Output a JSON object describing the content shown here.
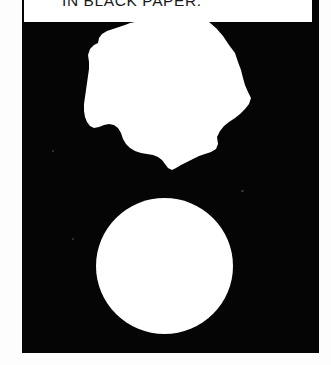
{
  "panel": {
    "caption": "IN BLACK PAPER.",
    "background_color": "#050505",
    "ink_color": "#ffffff",
    "caption_text_color": "#1a1a1a",
    "caption_background": "#ffffff",
    "page_background": "#fdfdfd"
  },
  "shapes": {
    "torn_paper": {
      "label": "torn-paper-blob",
      "description": "irregular white torn paper silhouette"
    },
    "circle": {
      "label": "white-circle",
      "description": "clean white circular disc"
    }
  }
}
